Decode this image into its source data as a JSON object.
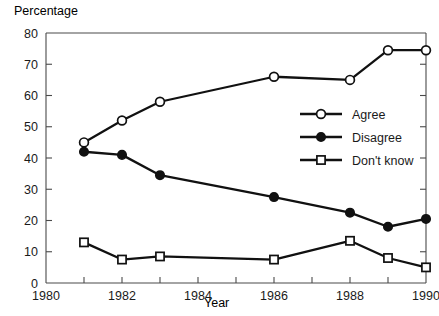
{
  "chart_data": {
    "type": "line",
    "title": "",
    "ylabel": "Percentage",
    "xlabel": "Year",
    "xlim": [
      1980,
      1990
    ],
    "ylim": [
      0,
      80
    ],
    "xticks": [
      1980,
      1981,
      1982,
      1983,
      1984,
      1985,
      1986,
      1987,
      1988,
      1989,
      1990
    ],
    "xticklabels": [
      "1980",
      "",
      "1982",
      "",
      "1984",
      "",
      "1986",
      "",
      "1988",
      "",
      "1990"
    ],
    "xticklabels_shown": [
      "1980",
      "1982",
      "1984",
      "1986",
      "1988",
      "1990"
    ],
    "yticks": [
      0,
      10,
      20,
      30,
      40,
      50,
      60,
      70,
      80
    ],
    "yticklabels": [
      "0",
      "10",
      "20",
      "30",
      "40",
      "50",
      "60",
      "70",
      "80"
    ],
    "grid": false,
    "legend_position": "center-right",
    "series": [
      {
        "name": "Agree",
        "marker": "open-circle",
        "x": [
          1981,
          1982,
          1983,
          1986,
          1988,
          1989,
          1990
        ],
        "values": [
          45,
          52,
          58,
          66,
          65,
          74.5,
          74.5
        ]
      },
      {
        "name": "Disagree",
        "marker": "filled-circle",
        "x": [
          1981,
          1982,
          1983,
          1986,
          1988,
          1989,
          1990
        ],
        "values": [
          42,
          41,
          34.5,
          27.5,
          22.5,
          18,
          20.5
        ]
      },
      {
        "name": "Don't know",
        "marker": "open-square",
        "x": [
          1981,
          1982,
          1983,
          1986,
          1988,
          1989,
          1990
        ],
        "values": [
          13,
          7.5,
          8.5,
          7.5,
          13.5,
          8,
          5
        ]
      }
    ]
  },
  "labels": {
    "y_axis_title": "Percentage",
    "x_axis_title": "Year",
    "y_ticks": [
      "80",
      "70",
      "60",
      "50",
      "40",
      "30",
      "20",
      "10",
      "0"
    ],
    "x_ticks": [
      "1980",
      "1982",
      "1984",
      "1986",
      "1988",
      "1990"
    ]
  },
  "legend": {
    "items": [
      {
        "label": "Agree",
        "marker": "open-circle"
      },
      {
        "label": "Disagree",
        "marker": "filled-circle"
      },
      {
        "label": "Don't know",
        "marker": "open-square"
      }
    ]
  },
  "colors": {
    "ink": "#111111",
    "axis": "#4a4a4a",
    "background": "#ffffff"
  }
}
